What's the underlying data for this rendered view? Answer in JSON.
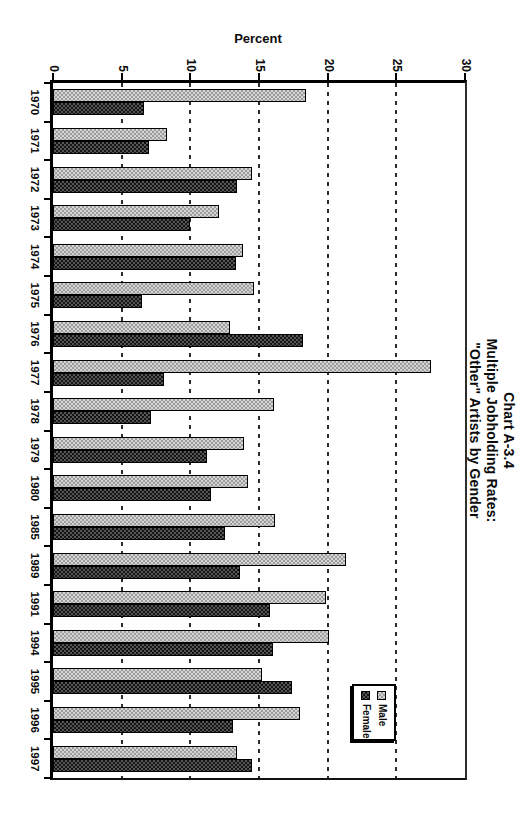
{
  "page": {
    "background": "#ffffff",
    "chart_rotation_on_page_deg": 90
  },
  "chart_data": {
    "type": "bar",
    "title_lines": [
      "Chart A-3.4",
      "Multiple Jobholding Rates:",
      "\"Other\" Artists by Gender"
    ],
    "ylabel": "Percent",
    "ylim": [
      0,
      30
    ],
    "yticks": [
      0,
      5,
      10,
      15,
      20,
      25,
      30
    ],
    "grid": "dashed gridlines at 5-percent intervals",
    "legend_position": "inside plot, right side, boxed with shadow",
    "categories": [
      "1970",
      "1971",
      "1972",
      "1973",
      "1974",
      "1975",
      "1976",
      "1977",
      "1978",
      "1979",
      "1980",
      "1985",
      "1989",
      "1991",
      "1994",
      "1995",
      "1996",
      "1997"
    ],
    "series": [
      {
        "name": "Male",
        "swatch": "light-checker",
        "color": "#d4d4d4",
        "values": [
          18.4,
          8.3,
          14.5,
          12.1,
          13.8,
          14.6,
          12.9,
          27.5,
          16.1,
          13.9,
          14.2,
          16.2,
          21.3,
          19.9,
          20.1,
          15.2,
          18.0,
          13.4
        ]
      },
      {
        "name": "Female",
        "swatch": "dark-checker",
        "color": "#555555",
        "values": [
          6.6,
          7.0,
          13.4,
          10.0,
          13.3,
          6.5,
          18.2,
          8.1,
          7.1,
          11.2,
          11.5,
          12.5,
          13.6,
          15.8,
          16.0,
          17.4,
          13.1,
          14.5
        ]
      }
    ]
  },
  "colors": {
    "axis": "#000000",
    "gridline": "#2b2b2b",
    "text": "#0a0a0a",
    "legend_border": "#000000"
  }
}
